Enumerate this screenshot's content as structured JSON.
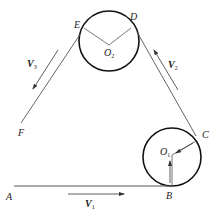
{
  "diagram": {
    "colors": {
      "line": "#555555",
      "circle": "#111111",
      "text": "#222222"
    },
    "points": {
      "A": "A",
      "B": "B",
      "C": "C",
      "D": "D",
      "E": "E",
      "F": "F"
    },
    "centers": {
      "O1": {
        "letter": "O",
        "sub": "1"
      },
      "O2": {
        "letter": "O",
        "sub": "2"
      }
    },
    "velocities": {
      "V1": {
        "letter": "V",
        "sub": "1",
        "direction": "right, along AB"
      },
      "V2": {
        "letter": "V",
        "sub": "2",
        "direction": "up-left, along CD"
      },
      "V3": {
        "letter": "V",
        "sub": "3",
        "direction": "down-left, along EF"
      }
    }
  }
}
